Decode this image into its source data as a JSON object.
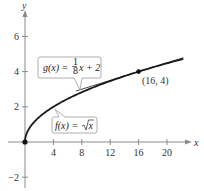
{
  "chart_data": {
    "type": "line",
    "title": "",
    "xlabel": "x",
    "ylabel": "y",
    "xlim": [
      0,
      23
    ],
    "ylim": [
      -2.5,
      7
    ],
    "x_ticks": [
      4,
      8,
      12,
      16,
      20
    ],
    "y_ticks": [
      -2,
      2,
      4,
      6
    ],
    "x_tick_labels": [
      "4",
      "8",
      "12",
      "16",
      "20"
    ],
    "y_tick_labels": [
      "−2",
      "2",
      "4",
      "6"
    ],
    "grid": false,
    "series": [
      {
        "name": "f(x) = √x",
        "function": "sqrt(x)",
        "x": [
          0,
          0.25,
          1,
          2,
          4,
          6,
          8,
          10,
          12,
          14,
          16,
          18,
          20,
          22.3
        ],
        "values": [
          0,
          0.5,
          1,
          1.414,
          2,
          2.449,
          2.828,
          3.162,
          3.464,
          3.742,
          4,
          4.243,
          4.472,
          4.722
        ]
      },
      {
        "name": "g(x) = (1/8)x + 2",
        "function": "x/8 + 2",
        "x": [
          7.2,
          22.3
        ],
        "values": [
          2.9,
          4.79
        ]
      }
    ],
    "points": [
      {
        "x": 0,
        "y": 0,
        "label": ""
      },
      {
        "x": 16,
        "y": 4,
        "label": "(16, 4)"
      }
    ],
    "annotations": [
      {
        "text": "g(x) = 1/8 x + 2",
        "target": "tangent line"
      },
      {
        "text": "f(x) = √x",
        "target": "curve"
      }
    ]
  },
  "labels": {
    "x_axis": "x",
    "y_axis": "y",
    "point": "(16, 4)",
    "g_prefix": "g(x) = ",
    "g_num": "1",
    "g_den": "8",
    "g_suffix": "x + 2",
    "f_prefix": "f(x) = ",
    "f_radicand": "x"
  },
  "colors": {
    "axis": "#8a8a8a",
    "curve": "#1a1a1a",
    "tangent": "#333333",
    "callout_border": "#9a9a9a",
    "callout_fill": "#ffffff"
  }
}
